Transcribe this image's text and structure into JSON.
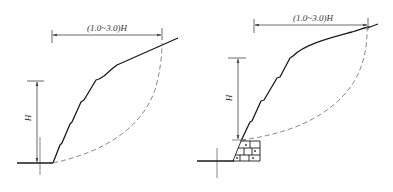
{
  "figure": {
    "panels": [
      {
        "id": "left",
        "description": "Stepped slope without retaining wall",
        "width_label": "(1.0~3.0)H",
        "height_label": "H"
      },
      {
        "id": "right",
        "description": "Stepped slope with masonry retaining wall at toe",
        "width_label": "(1.0~3.0)H",
        "height_label": "H"
      }
    ],
    "colors": {
      "line": "#1a1a1a",
      "dim_line": "#444444",
      "dashed_arc": "#777777"
    }
  }
}
